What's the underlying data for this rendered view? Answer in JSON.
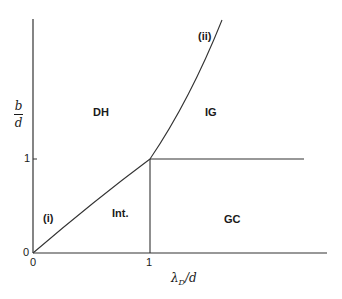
{
  "diagram": {
    "title": "",
    "regions": [
      {
        "id": "DH",
        "label": "DH"
      },
      {
        "id": "IG",
        "label": "IG"
      },
      {
        "id": "Int",
        "label": "Int."
      },
      {
        "id": "GC",
        "label": "GC"
      }
    ],
    "curve_labels": {
      "i": "(i)",
      "ii": "(ii)"
    },
    "x_axis": {
      "label_main": "λ",
      "label_sub": "D",
      "label_tail": "/d",
      "ticks": [
        "0",
        "1"
      ]
    },
    "y_axis": {
      "label_num": "b",
      "label_den": "d",
      "ticks": [
        "0",
        "1"
      ]
    },
    "colors": {
      "line": "#333333",
      "text": "#1a1a1a",
      "background": "#ffffff"
    }
  }
}
